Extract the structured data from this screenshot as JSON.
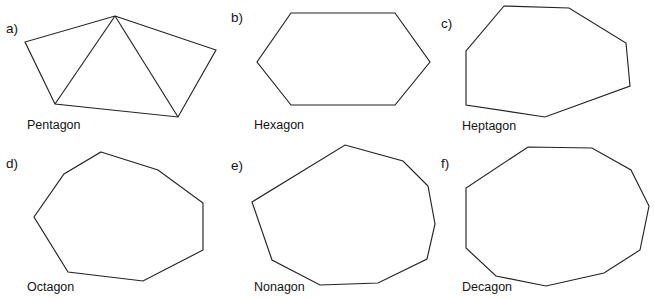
{
  "figure": {
    "width": 655,
    "height": 300,
    "background_color": "#ffffff",
    "stroke_color": "#232323",
    "text_color": "#141414"
  },
  "panels": [
    {
      "key": "pentagon",
      "enumerator": "a)",
      "name": "Pentagon",
      "sides": 5,
      "enum_pos": {
        "x": 6,
        "y": 33
      },
      "label_pos": {
        "x": 27,
        "y": 129
      },
      "points": "115,16 216,50 178,117 55,104 25,42",
      "diagonals": [
        "115,16 55,104",
        "115,16 178,117"
      ]
    },
    {
      "key": "hexagon",
      "enumerator": "b)",
      "name": "Hexagon",
      "sides": 6,
      "enum_pos": {
        "x": 231,
        "y": 22
      },
      "label_pos": {
        "x": 254,
        "y": 129
      },
      "points": "291,13 395,13 430,62 395,105 291,105 257,62",
      "diagonals": []
    },
    {
      "key": "heptagon",
      "enumerator": "c)",
      "name": "Heptagon",
      "sides": 7,
      "enum_pos": {
        "x": 441,
        "y": 28
      },
      "label_pos": {
        "x": 462,
        "y": 130
      },
      "points": "504,6 569,8 626,43 630,86 545,117 466,105 466,51",
      "diagonals": []
    },
    {
      "key": "octagon",
      "enumerator": "d)",
      "name": "Octagon",
      "sides": 8,
      "enum_pos": {
        "x": 6,
        "y": 168
      },
      "label_pos": {
        "x": 27,
        "y": 291
      },
      "points": "101,152 158,170 203,203 203,250 143,281 68,272 34,217 64,174"
    },
    {
      "key": "nonagon",
      "enumerator": "e)",
      "name": "Nonagon",
      "sides": 9,
      "enum_pos": {
        "x": 231,
        "y": 170
      },
      "label_pos": {
        "x": 254,
        "y": 291
      },
      "points": "345,145 403,161 428,186 435,224 427,259 378,283 320,285 272,260 252,202"
    },
    {
      "key": "decagon",
      "enumerator": "f)",
      "name": "Decagon",
      "sides": 10,
      "enum_pos": {
        "x": 441,
        "y": 168
      },
      "label_pos": {
        "x": 462,
        "y": 291
      },
      "points": "528,147 592,148 631,170 649,206 640,250 604,273 546,286 496,276 466,248 466,188"
    }
  ]
}
